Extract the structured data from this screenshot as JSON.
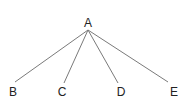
{
  "diagram": {
    "type": "tree",
    "root": {
      "id": "A",
      "label": "A",
      "x": 88,
      "y": 27,
      "anchor_y": 30
    },
    "children": [
      {
        "id": "B",
        "label": "B",
        "x": 13,
        "y": 96,
        "edge_end": [
          15,
          82
        ]
      },
      {
        "id": "C",
        "label": "C",
        "x": 62,
        "y": 96,
        "edge_end": [
          64,
          83
        ]
      },
      {
        "id": "D",
        "label": "D",
        "x": 121,
        "y": 96,
        "edge_end": [
          118,
          83
        ]
      },
      {
        "id": "E",
        "label": "E",
        "x": 174,
        "y": 96,
        "edge_end": [
          168,
          82
        ]
      }
    ],
    "edges": [
      {
        "from": "A",
        "to": "B"
      },
      {
        "from": "A",
        "to": "C"
      },
      {
        "from": "A",
        "to": "D"
      },
      {
        "from": "A",
        "to": "E"
      }
    ],
    "colors": {
      "edge": "#7a7a7a",
      "text": "#222222",
      "background": "#ffffff"
    }
  }
}
